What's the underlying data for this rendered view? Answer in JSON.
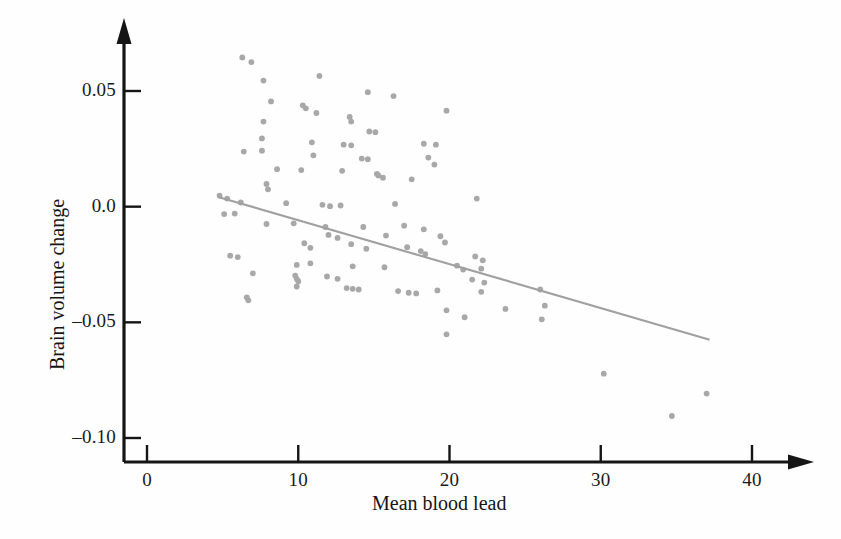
{
  "chart_data": {
    "type": "scatter",
    "title": "",
    "xlabel": "Mean blood lead",
    "ylabel": "Brain volume change",
    "xlim": [
      0,
      42.5
    ],
    "ylim": [
      -0.115,
      0.072
    ],
    "xticks": [
      0,
      10,
      20,
      30,
      40
    ],
    "xtick_labels": [
      "0",
      "10",
      "20",
      "30",
      "40"
    ],
    "yticks": [
      0.05,
      0.0,
      -0.05,
      -0.1
    ],
    "ytick_labels": [
      "0.05",
      "0.0",
      "–0.05",
      "–0.10"
    ],
    "grid": false,
    "legend": "none",
    "marker_color": "#a8a8a8",
    "line_color": "#a0a0a0",
    "axis_color": "#151515",
    "marker_size": 5,
    "series": [
      {
        "name": "Participants",
        "type": "scatter",
        "points": [
          [
            6.3,
            0.0645
          ],
          [
            6.9,
            0.0625
          ],
          [
            7.7,
            0.0545
          ],
          [
            11.4,
            0.0565
          ],
          [
            14.6,
            0.0495
          ],
          [
            16.3,
            0.0478
          ],
          [
            8.2,
            0.0455
          ],
          [
            10.3,
            0.0438
          ],
          [
            10.5,
            0.0425
          ],
          [
            11.2,
            0.0405
          ],
          [
            13.4,
            0.0388
          ],
          [
            13.5,
            0.0368
          ],
          [
            19.8,
            0.0415
          ],
          [
            7.7,
            0.0368
          ],
          [
            14.7,
            0.0325
          ],
          [
            15.1,
            0.0322
          ],
          [
            7.6,
            0.0295
          ],
          [
            10.9,
            0.0278
          ],
          [
            13.0,
            0.0268
          ],
          [
            13.5,
            0.0265
          ],
          [
            18.3,
            0.0272
          ],
          [
            19.1,
            0.0268
          ],
          [
            6.4,
            0.0238
          ],
          [
            7.6,
            0.0242
          ],
          [
            11.0,
            0.0222
          ],
          [
            14.2,
            0.0208
          ],
          [
            14.6,
            0.0205
          ],
          [
            18.6,
            0.0212
          ],
          [
            19.0,
            0.0182
          ],
          [
            8.6,
            0.0162
          ],
          [
            10.2,
            0.0158
          ],
          [
            12.9,
            0.0155
          ],
          [
            15.2,
            0.0142
          ],
          [
            15.3,
            0.0135
          ],
          [
            15.6,
            0.0125
          ],
          [
            17.5,
            0.0118
          ],
          [
            4.8,
            0.0048
          ],
          [
            5.3,
            0.0035
          ],
          [
            6.2,
            0.0018
          ],
          [
            7.9,
            0.0098
          ],
          [
            8.0,
            0.0075
          ],
          [
            9.2,
            0.0015
          ],
          [
            11.6,
            0.0008
          ],
          [
            12.1,
            0.0002
          ],
          [
            12.8,
            0.0005
          ],
          [
            16.4,
            0.0012
          ],
          [
            21.8,
            0.0035
          ],
          [
            5.1,
            -0.0032
          ],
          [
            5.8,
            -0.003
          ],
          [
            7.9,
            -0.0075
          ],
          [
            9.7,
            -0.0072
          ],
          [
            11.8,
            -0.0088
          ],
          [
            14.3,
            -0.0088
          ],
          [
            17.0,
            -0.0082
          ],
          [
            18.3,
            -0.0098
          ],
          [
            12.0,
            -0.0122
          ],
          [
            12.6,
            -0.0135
          ],
          [
            15.8,
            -0.0125
          ],
          [
            19.4,
            -0.0128
          ],
          [
            19.7,
            -0.0155
          ],
          [
            10.4,
            -0.0158
          ],
          [
            10.8,
            -0.0178
          ],
          [
            13.5,
            -0.0162
          ],
          [
            14.5,
            -0.0182
          ],
          [
            17.2,
            -0.0175
          ],
          [
            18.1,
            -0.0192
          ],
          [
            18.4,
            -0.0205
          ],
          [
            5.5,
            -0.0212
          ],
          [
            6.0,
            -0.0218
          ],
          [
            21.7,
            -0.0215
          ],
          [
            22.2,
            -0.0232
          ],
          [
            9.9,
            -0.0252
          ],
          [
            10.8,
            -0.0245
          ],
          [
            13.6,
            -0.0258
          ],
          [
            15.7,
            -0.0262
          ],
          [
            20.5,
            -0.0255
          ],
          [
            20.9,
            -0.0272
          ],
          [
            22.1,
            -0.0268
          ],
          [
            7.0,
            -0.0288
          ],
          [
            9.8,
            -0.0298
          ],
          [
            9.9,
            -0.0312
          ],
          [
            10.0,
            -0.0322
          ],
          [
            11.9,
            -0.0302
          ],
          [
            12.6,
            -0.0312
          ],
          [
            21.5,
            -0.0315
          ],
          [
            22.3,
            -0.0328
          ],
          [
            9.9,
            -0.0345
          ],
          [
            13.2,
            -0.0352
          ],
          [
            13.6,
            -0.0355
          ],
          [
            14.0,
            -0.0358
          ],
          [
            16.6,
            -0.0365
          ],
          [
            19.2,
            -0.0362
          ],
          [
            22.1,
            -0.0368
          ],
          [
            26.0,
            -0.0358
          ],
          [
            6.6,
            -0.0392
          ],
          [
            6.7,
            -0.0405
          ],
          [
            17.3,
            -0.0372
          ],
          [
            17.8,
            -0.0375
          ],
          [
            26.3,
            -0.0428
          ],
          [
            19.8,
            -0.0448
          ],
          [
            23.7,
            -0.0442
          ],
          [
            21.0,
            -0.0478
          ],
          [
            26.1,
            -0.0487
          ],
          [
            19.8,
            -0.0552
          ],
          [
            30.2,
            -0.0722
          ],
          [
            34.7,
            -0.0905
          ],
          [
            37.0,
            -0.0808
          ]
        ]
      },
      {
        "name": "Regression line",
        "type": "line",
        "points": [
          [
            4.7,
            0.0042
          ],
          [
            37.2,
            -0.0575
          ]
        ]
      }
    ]
  }
}
